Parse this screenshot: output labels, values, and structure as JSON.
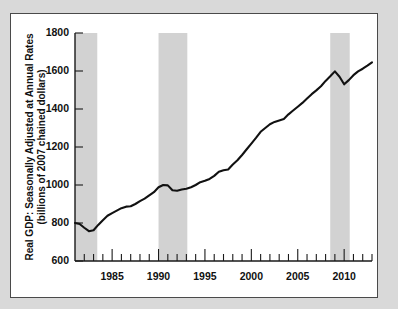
{
  "chart_data": {
    "type": "line",
    "title": "",
    "xlabel": "",
    "ylabel_line1": "Real GDP: Seasonally Adjusted at Annual Rates",
    "ylabel_line2": "(billions of 2007 chained dollars)",
    "ylim": [
      600,
      1800
    ],
    "xlim": [
      1981.0,
      2013.0
    ],
    "ytick_values": [
      600,
      800,
      1000,
      1200,
      1400,
      1600,
      1800
    ],
    "ytick_labels": [
      "600",
      "800",
      "1000",
      "1200",
      "1400",
      "1600",
      "1800"
    ],
    "xtick_major_values": [
      1985,
      1990,
      1995,
      2000,
      2005,
      2010
    ],
    "xtick_major_labels": [
      "1985",
      "1990",
      "1995",
      "2000",
      "2005",
      "2010"
    ],
    "xtick_minor_values": [
      1982,
      1983,
      1984,
      1986,
      1987,
      1988,
      1989,
      1991,
      1992,
      1993,
      1994,
      1996,
      1997,
      1998,
      1999,
      2001,
      2002,
      2003,
      2004,
      2006,
      2007,
      2008,
      2009,
      2011,
      2012,
      2013
    ],
    "grid": false,
    "legend": "none",
    "line_color": "#111111",
    "recession_band_color": "#d2d2d2",
    "background_color": "#ffffff",
    "page_background_color": "#d9d9d9",
    "recession_bands": [
      {
        "start": 1981.0,
        "end": 1983.4
      },
      {
        "start": 1990.0,
        "end": 1993.1
      },
      {
        "start": 2008.5,
        "end": 2010.6
      }
    ],
    "x": [
      1981.0,
      1981.5,
      1982.0,
      1982.5,
      1983.0,
      1983.5,
      1984.0,
      1984.5,
      1985.0,
      1985.5,
      1986.0,
      1986.5,
      1987.0,
      1987.5,
      1988.0,
      1988.5,
      1989.0,
      1989.5,
      1990.0,
      1990.5,
      1991.0,
      1991.5,
      1992.0,
      1992.5,
      1993.0,
      1993.5,
      1994.0,
      1994.5,
      1995.0,
      1995.5,
      1996.0,
      1996.5,
      1997.0,
      1997.5,
      1998.0,
      1998.5,
      1999.0,
      1999.5,
      2000.0,
      2000.5,
      2001.0,
      2001.5,
      2002.0,
      2002.5,
      2003.0,
      2003.5,
      2004.0,
      2004.5,
      2005.0,
      2005.5,
      2006.0,
      2006.5,
      2007.0,
      2007.5,
      2008.0,
      2008.5,
      2009.0,
      2009.5,
      2010.0,
      2010.5,
      2011.0,
      2011.5,
      2012.0,
      2012.5,
      2013.0
    ],
    "values": [
      800,
      795,
      775,
      757,
      762,
      790,
      815,
      838,
      852,
      865,
      878,
      886,
      888,
      900,
      915,
      928,
      945,
      962,
      988,
      1000,
      998,
      972,
      970,
      976,
      980,
      988,
      1000,
      1015,
      1022,
      1032,
      1048,
      1070,
      1078,
      1082,
      1108,
      1130,
      1158,
      1188,
      1218,
      1248,
      1280,
      1300,
      1320,
      1332,
      1340,
      1348,
      1372,
      1392,
      1412,
      1432,
      1455,
      1478,
      1498,
      1520,
      1548,
      1572,
      1598,
      1570,
      1530,
      1552,
      1578,
      1598,
      1612,
      1628,
      1645
    ]
  }
}
